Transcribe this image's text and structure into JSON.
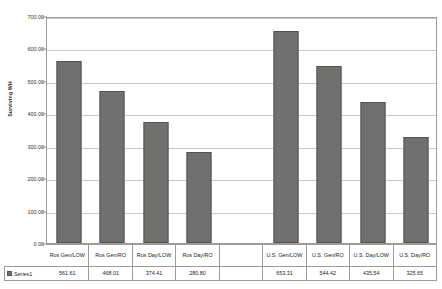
{
  "chart_data": {
    "type": "bar",
    "title": "",
    "xlabel": "",
    "ylabel": "Surviving WH",
    "ylim": [
      0,
      700
    ],
    "ytick_labels": [
      "700.00",
      "600.00",
      "500.00",
      "400.00",
      "300.00",
      "200.00",
      "100.00",
      "0.00"
    ],
    "ytick_values": [
      700,
      600,
      500,
      400,
      300,
      200,
      100,
      0
    ],
    "grid": true,
    "legend_position": "bottom-left-table",
    "categories": [
      "Rus Gen/LOW",
      "Rus Gen/RO",
      "Rus Day/LOW",
      "Rus Day/RO",
      "",
      "U.S. Gen/LOW",
      "U.S. Gen/RO",
      "U.S. Day/LOW",
      "U.S. Day/RO"
    ],
    "series": [
      {
        "name": "Series1",
        "color": "#70706e",
        "values": [
          561.61,
          468.01,
          374.41,
          280.8,
          null,
          653.31,
          544.42,
          435.54,
          325.65
        ],
        "value_labels": [
          "561.61",
          "468.01",
          "374.41",
          "280.80",
          "",
          "653.31",
          "544.42",
          "435.54",
          "325.65"
        ]
      }
    ]
  },
  "legend": {
    "series_label": "Series1"
  },
  "colors": {
    "bar_fill": "#70706e",
    "bar_border": "#54544f",
    "gridline": "#c9c9c9",
    "frame": "#9b9b9b",
    "background": "#ffffff"
  }
}
